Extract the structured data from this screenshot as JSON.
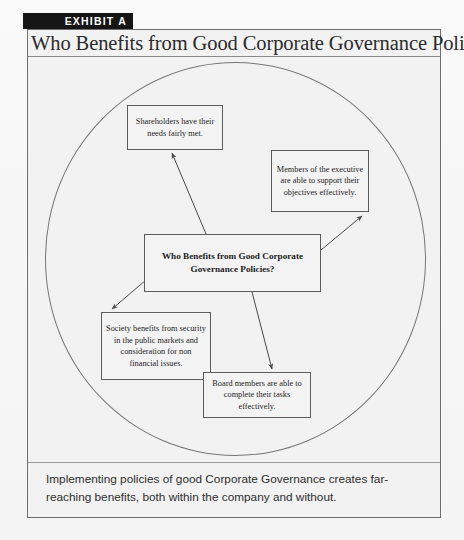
{
  "exhibit": {
    "banner_label": "EXHIBIT A",
    "banner_color": "#161616"
  },
  "title": "Who Benefits from Good Corporate Governance Policies?",
  "diagram": {
    "shape": "circle",
    "center_node": {
      "id": "center",
      "text": "Who Benefits from Good Corporate Governance Policies?"
    },
    "nodes": [
      {
        "id": "shareholders",
        "text": "Shareholders have their needs fairly met."
      },
      {
        "id": "executive",
        "text": "Members of the executive are able to support their objectives effectively."
      },
      {
        "id": "society",
        "text": "Society benefits from security in the public markets and consideration for non financial issues."
      },
      {
        "id": "board",
        "text": "Board members are able to complete their tasks effectively."
      }
    ]
  },
  "caption": "Implementing policies of good Corporate Governance creates far-reaching benefits, both within the company and without.",
  "colors": {
    "page_background": "#f4f4f4",
    "frame_border": "#6e6e6e",
    "box_border": "#5d5d5d",
    "box_fill": "#f3f3f3",
    "text": "#1d1d1d",
    "arrow": "#4a4a4a"
  }
}
